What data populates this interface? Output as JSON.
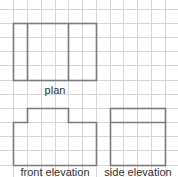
{
  "diagram": {
    "grid": {
      "spacing": 13.7,
      "color": "#d4d4d4",
      "line_color_shape": "#777777"
    },
    "views": [
      {
        "id": "plan",
        "label": "plan"
      },
      {
        "id": "front",
        "label": "front elevation"
      },
      {
        "id": "side",
        "label": "side elevation"
      }
    ]
  }
}
